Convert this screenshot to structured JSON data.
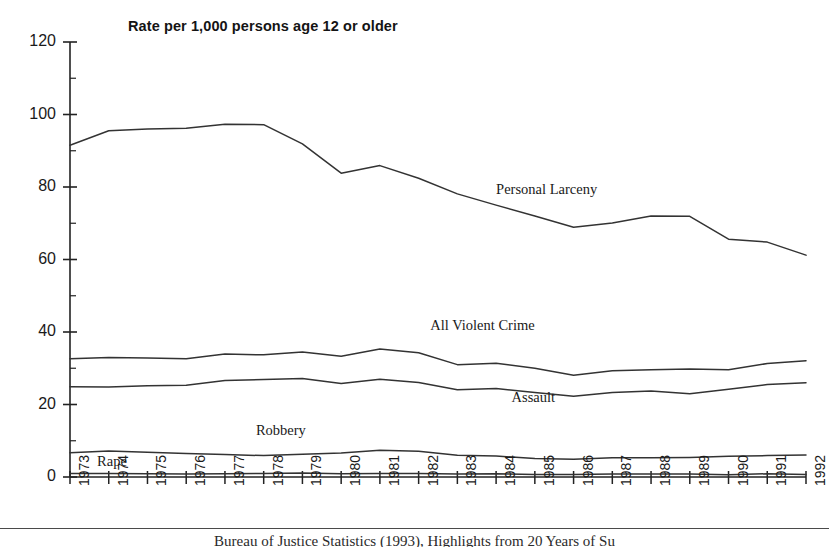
{
  "chart_data": {
    "type": "line",
    "title": "Rate per 1,000 persons age 12 or older",
    "xlabel": "",
    "ylabel": "",
    "xlim": [
      1973,
      1992
    ],
    "ylim": [
      0,
      120
    ],
    "ytick_step": 20,
    "grid": false,
    "legend_position": "inline-annotations",
    "categories": [
      1973,
      1974,
      1975,
      1976,
      1977,
      1978,
      1979,
      1980,
      1981,
      1982,
      1983,
      1984,
      1985,
      1986,
      1987,
      1988,
      1989,
      1990,
      1991,
      1992
    ],
    "xtick_labels": [
      "1973",
      "1974",
      "1975",
      "1976",
      "1977",
      "1978",
      "1979",
      "1980",
      "1981",
      "1982",
      "1983",
      "1984",
      "1985",
      "1986",
      "1987",
      "1988",
      "1989",
      "1990",
      "1991",
      "1992"
    ],
    "ytick_labels": [
      "0",
      "20",
      "40",
      "60",
      "80",
      "100",
      "120"
    ],
    "ytick_values": [
      0,
      20,
      40,
      60,
      80,
      100,
      120
    ],
    "series": [
      {
        "name": "Personal Larceny",
        "label": "Personal Larceny",
        "color": "#333333",
        "values": [
          91.5,
          95.5,
          96.0,
          96.2,
          97.3,
          97.2,
          91.9,
          83.8,
          85.9,
          82.4,
          78.1,
          75.0,
          72.0,
          68.9,
          70.1,
          72.0,
          71.9,
          65.6,
          64.8,
          61.2
        ]
      },
      {
        "name": "All Violent Crime",
        "label": "All Violent Crime",
        "color": "#333333",
        "values": [
          32.6,
          33.0,
          32.8,
          32.6,
          33.9,
          33.7,
          34.5,
          33.3,
          35.3,
          34.3,
          31.0,
          31.4,
          30.0,
          28.1,
          29.3,
          29.6,
          29.8,
          29.6,
          31.3,
          32.1
        ]
      },
      {
        "name": "Assault",
        "label": "Assault",
        "color": "#333333",
        "values": [
          24.9,
          24.8,
          25.2,
          25.3,
          26.6,
          26.9,
          27.2,
          25.8,
          27.0,
          26.1,
          24.1,
          24.4,
          23.3,
          22.3,
          23.3,
          23.7,
          23.0,
          24.2,
          25.5,
          26.0
        ]
      },
      {
        "name": "Robbery",
        "label": "Robbery",
        "color": "#333333",
        "values": [
          6.7,
          7.2,
          6.8,
          6.5,
          6.2,
          5.9,
          6.3,
          6.6,
          7.4,
          7.1,
          6.0,
          5.8,
          5.1,
          4.9,
          5.3,
          5.3,
          5.4,
          5.7,
          5.9,
          6.1
        ]
      },
      {
        "name": "Rape",
        "label": "Rape",
        "color": "#333333",
        "values": [
          1.0,
          1.0,
          0.9,
          0.8,
          0.9,
          1.0,
          1.1,
          0.9,
          1.0,
          1.0,
          0.8,
          0.9,
          0.7,
          0.7,
          0.8,
          0.8,
          0.8,
          0.6,
          0.9,
          0.7
        ]
      }
    ],
    "annotations": [
      {
        "text": "Personal Larceny",
        "x": 1984.0,
        "y": 79.0
      },
      {
        "text": "All Violent Crime",
        "x": 1982.3,
        "y": 41.5
      },
      {
        "text": "Assault",
        "x": 1984.4,
        "y": 21.5
      },
      {
        "text": "Robbery",
        "x": 1977.8,
        "y": 12.5
      },
      {
        "text": "Rape",
        "x": 1973.7,
        "y": 4.0
      }
    ]
  },
  "footer": {
    "caption": "Bureau of Justice Statistics (1993), Highlights from 20 Years of Su"
  }
}
